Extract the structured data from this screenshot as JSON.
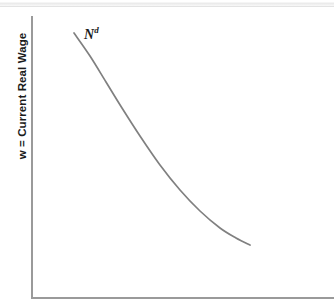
{
  "figure": {
    "background_color": "#ffffff",
    "axis_color": "#9a9a9a",
    "curve_color": "#808080",
    "text_color": "#1b1b1b",
    "top_rule_color": "#e9e9e9"
  },
  "axes": {
    "y_title": "w = Current Real Wage",
    "x_title": ""
  },
  "annotations": {
    "curve_label_base": "N",
    "curve_label_sup": "d"
  },
  "chart_data": {
    "type": "line",
    "title": "",
    "xlabel": "",
    "ylabel": "w = Current Real Wage",
    "grid": false,
    "legend": "none",
    "axis_ticks": {
      "x": [],
      "y": []
    },
    "series": [
      {
        "name": "N^d",
        "label": "Nd",
        "description": "Downward-sloping, convex-to-origin labor demand curve",
        "color": "#808080",
        "x": [
          74,
          90,
          106,
          122,
          140,
          160,
          180,
          200,
          220,
          236,
          250
        ],
        "y": [
          33,
          56,
          82,
          108,
          136,
          165,
          190,
          211,
          228,
          238,
          245
        ]
      }
    ],
    "xlim": [
      31,
      334
    ],
    "ylim": [
      298,
      16
    ]
  }
}
